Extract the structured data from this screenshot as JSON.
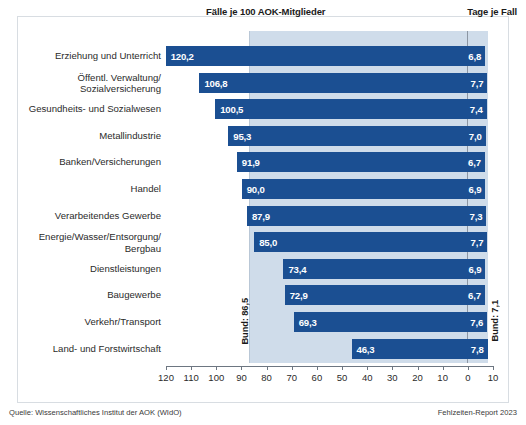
{
  "header": {
    "cases_title": "Fälle je 100 AOK-Mitglieder",
    "days_title": "Tage je Fall"
  },
  "annotations": {
    "bund_cases_label": "Bund: 86,5",
    "bund_days_label": "Bund: 7,1"
  },
  "footer": {
    "source": "Quelle: Wissenschaftliches Institut der AOK (WIdO)",
    "report": "Fehlzeiten-Report 2023"
  },
  "colors": {
    "bar": "#1b4f92",
    "band": "#cfdcea",
    "zero_line": "#8c96a3",
    "card_border": "#d8dde2",
    "text": "#2b2b2b"
  },
  "chart_data": {
    "type": "bar",
    "title": "",
    "xlabel": "",
    "ylabel": "",
    "orientation": "horizontal",
    "grid": false,
    "legend": false,
    "xlim": [
      120,
      -10
    ],
    "x_ticks": [
      "120",
      "110",
      "100",
      "90",
      "80",
      "70",
      "60",
      "50",
      "40",
      "30",
      "20",
      "10",
      "0",
      "10"
    ],
    "x_tick_values": [
      120,
      110,
      100,
      90,
      80,
      70,
      60,
      50,
      40,
      30,
      20,
      10,
      0,
      10
    ],
    "reference_lines": [
      {
        "name": "Bund Fälle je 100 AOK-Mitglieder",
        "value": 86.5,
        "label": "Bund: 86,5"
      },
      {
        "name": "Bund Tage je Fall",
        "value": 7.1,
        "label": "Bund: 7,1"
      }
    ],
    "categories": [
      "Erziehung und Unterricht",
      "Öffentl. Verwaltung/\nSozialversicherung",
      "Gesundheits- und Sozialwesen",
      "Metallindustrie",
      "Banken/Versicherungen",
      "Handel",
      "Verarbeitendes Gewerbe",
      "Energie/Wasser/Entsorgung/\nBergbau",
      "Dienstleistungen",
      "Baugewerbe",
      "Verkehr/Transport",
      "Land- und Forstwirtschaft"
    ],
    "series": [
      {
        "name": "Fälle je 100 AOK-Mitglieder",
        "values": [
          120.2,
          106.8,
          100.5,
          95.3,
          91.9,
          90.0,
          87.9,
          85.0,
          73.4,
          72.9,
          69.3,
          46.3
        ],
        "labels": [
          "120,2",
          "106,8",
          "100,5",
          "95,3",
          "91,9",
          "90,0",
          "87,9",
          "85,0",
          "73,4",
          "72,9",
          "69,3",
          "46,3"
        ]
      },
      {
        "name": "Tage je Fall",
        "values": [
          6.8,
          7.7,
          7.4,
          7.0,
          6.7,
          6.9,
          7.3,
          7.7,
          6.9,
          6.7,
          7.6,
          7.8
        ],
        "labels": [
          "6,8",
          "7,7",
          "7,4",
          "7,0",
          "6,7",
          "6,9",
          "7,3",
          "7,7",
          "6,9",
          "6,7",
          "7,6",
          "7,8"
        ]
      }
    ],
    "rows": [
      {
        "label": "Erziehung und Unterricht",
        "label_line2": "",
        "cases": 120.2,
        "cases_label": "120,2",
        "days": 6.8,
        "days_label": "6,8"
      },
      {
        "label": "Öffentl. Verwaltung/",
        "label_line2": "Sozialversicherung",
        "cases": 106.8,
        "cases_label": "106,8",
        "days": 7.7,
        "days_label": "7,7"
      },
      {
        "label": "Gesundheits- und Sozialwesen",
        "label_line2": "",
        "cases": 100.5,
        "cases_label": "100,5",
        "days": 7.4,
        "days_label": "7,4"
      },
      {
        "label": "Metallindustrie",
        "label_line2": "",
        "cases": 95.3,
        "cases_label": "95,3",
        "days": 7.0,
        "days_label": "7,0"
      },
      {
        "label": "Banken/Versicherungen",
        "label_line2": "",
        "cases": 91.9,
        "cases_label": "91,9",
        "days": 6.7,
        "days_label": "6,7"
      },
      {
        "label": "Handel",
        "label_line2": "",
        "cases": 90.0,
        "cases_label": "90,0",
        "days": 6.9,
        "days_label": "6,9"
      },
      {
        "label": "Verarbeitendes Gewerbe",
        "label_line2": "",
        "cases": 87.9,
        "cases_label": "87,9",
        "days": 7.3,
        "days_label": "7,3"
      },
      {
        "label": "Energie/Wasser/Entsorgung/",
        "label_line2": "Bergbau",
        "cases": 85.0,
        "cases_label": "85,0",
        "days": 7.7,
        "days_label": "7,7"
      },
      {
        "label": "Dienstleistungen",
        "label_line2": "",
        "cases": 73.4,
        "cases_label": "73,4",
        "days": 6.9,
        "days_label": "6,9"
      },
      {
        "label": "Baugewerbe",
        "label_line2": "",
        "cases": 72.9,
        "cases_label": "72,9",
        "days": 6.7,
        "days_label": "6,7"
      },
      {
        "label": "Verkehr/Transport",
        "label_line2": "",
        "cases": 69.3,
        "cases_label": "69,3",
        "days": 7.6,
        "days_label": "7,6"
      },
      {
        "label": "Land- und Forstwirtschaft",
        "label_line2": "",
        "cases": 46.3,
        "cases_label": "46,3",
        "days": 7.8,
        "days_label": "7,8"
      }
    ]
  }
}
